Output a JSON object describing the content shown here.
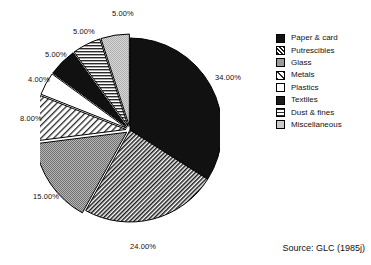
{
  "chart_data": {
    "type": "pie",
    "title": "",
    "subtitle": "",
    "xlabel": "",
    "ylabel": "",
    "legend_position": "right",
    "grid": false,
    "start_angle_deg": 0,
    "direction": "clockwise",
    "categories": [
      "Paper & card",
      "Putrescibles",
      "Glass",
      "Metals",
      "Plastics",
      "Textiles",
      "Dust & fines",
      "Miscellaneous"
    ],
    "values": [
      34,
      24,
      15,
      8,
      4,
      5,
      5,
      5
    ],
    "value_labels": [
      "34.00%",
      "24.00%",
      "15.00%",
      "8.00%",
      "4.00%",
      "5.00%",
      "5.00%",
      "5.00%"
    ],
    "slice_fills": [
      "solid-black",
      "diagonal-hatch-dense",
      "gray-dotted",
      "diagonal-hatch-sparse",
      "white",
      "solid-black",
      "horizontal-lines",
      "light-gray"
    ],
    "annotations": [
      "Source: GLC (1985j)"
    ]
  },
  "legend": {
    "items": [
      {
        "label": "Paper & card",
        "swatch": "solid-black"
      },
      {
        "label": "Putrescibles",
        "swatch": "diagonal-hatch-dense"
      },
      {
        "label": "Glass",
        "swatch": "gray-dotted"
      },
      {
        "label": "Metals",
        "swatch": "diagonal-hatch-sparse"
      },
      {
        "label": "Plastics",
        "swatch": "white"
      },
      {
        "label": "Textiles",
        "swatch": "solid-black"
      },
      {
        "label": "Dust & fines",
        "swatch": "horizontal-lines"
      },
      {
        "label": "Miscellaneous",
        "swatch": "light-gray"
      }
    ]
  },
  "source": {
    "text": "Source: GLC (1985j)"
  },
  "colors": {
    "outline": "#000000",
    "black_fill": "#111111",
    "gray_fill": "#9a9a9a",
    "light_gray_fill": "#c9c9c9",
    "white_fill": "#ffffff",
    "text": "#111111",
    "background": "#ffffff"
  }
}
